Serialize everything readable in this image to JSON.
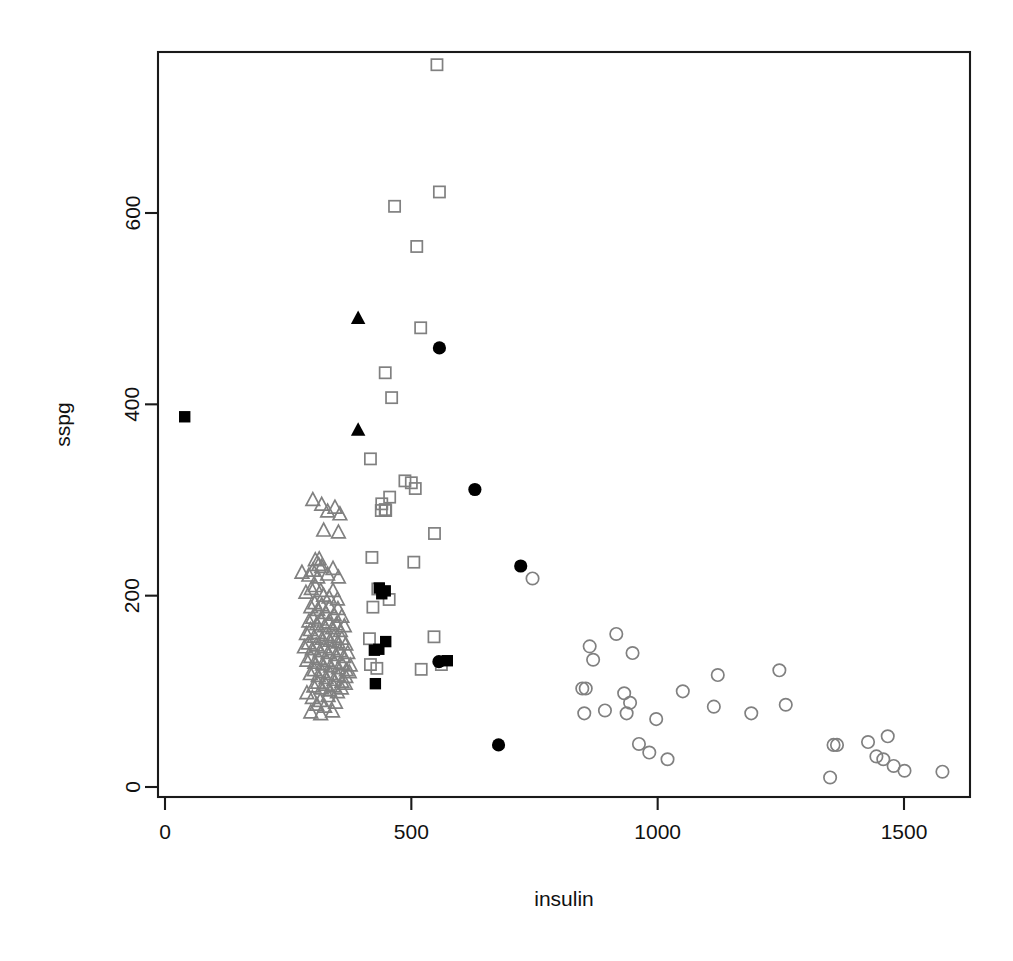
{
  "chart_data": {
    "type": "scatter",
    "title": "",
    "subtitle": "",
    "xlabel": "insulin",
    "ylabel": "sspg",
    "xlim": [
      -40,
      1640
    ],
    "ylim": [
      -35,
      790
    ],
    "xticks": [
      0,
      500,
      1000,
      1500
    ],
    "yticks": [
      0,
      200,
      400,
      600
    ],
    "xtick_labels": [
      "0",
      "500",
      "1000",
      "1500"
    ],
    "ytick_labels": [
      "0",
      "200",
      "400",
      "600"
    ],
    "grid": false,
    "legend": "none",
    "box": true,
    "colors": {
      "grey_marker": "#808080",
      "black_marker": "#000000",
      "axis": "#1a1a1a",
      "background": "#ffffff"
    },
    "series": [
      {
        "name": "open-triangle-grey",
        "marker": "triangle",
        "filled": false,
        "color": "#808080",
        "points": [
          [
            300,
            300
          ],
          [
            318,
            295
          ],
          [
            330,
            288
          ],
          [
            345,
            292
          ],
          [
            355,
            285
          ],
          [
            322,
            268
          ],
          [
            352,
            266
          ],
          [
            305,
            237
          ],
          [
            313,
            238
          ],
          [
            312,
            232
          ],
          [
            278,
            224
          ],
          [
            292,
            221
          ],
          [
            300,
            226
          ],
          [
            310,
            219
          ],
          [
            318,
            230
          ],
          [
            330,
            222
          ],
          [
            341,
            228
          ],
          [
            352,
            219
          ],
          [
            297,
            207
          ],
          [
            305,
            210
          ],
          [
            286,
            203
          ],
          [
            316,
            205
          ],
          [
            322,
            200
          ],
          [
            333,
            198
          ],
          [
            341,
            205
          ],
          [
            350,
            196
          ],
          [
            296,
            188
          ],
          [
            304,
            192
          ],
          [
            310,
            185
          ],
          [
            318,
            190
          ],
          [
            326,
            182
          ],
          [
            334,
            188
          ],
          [
            343,
            180
          ],
          [
            351,
            186
          ],
          [
            359,
            178
          ],
          [
            292,
            173
          ],
          [
            300,
            177
          ],
          [
            308,
            170
          ],
          [
            316,
            175
          ],
          [
            324,
            168
          ],
          [
            332,
            172
          ],
          [
            340,
            166
          ],
          [
            348,
            170
          ],
          [
            356,
            163
          ],
          [
            364,
            168
          ],
          [
            287,
            160
          ],
          [
            295,
            164
          ],
          [
            303,
            157
          ],
          [
            311,
            161
          ],
          [
            319,
            155
          ],
          [
            327,
            159
          ],
          [
            335,
            153
          ],
          [
            343,
            157
          ],
          [
            351,
            151
          ],
          [
            359,
            155
          ],
          [
            367,
            149
          ],
          [
            283,
            146
          ],
          [
            291,
            150
          ],
          [
            299,
            144
          ],
          [
            307,
            148
          ],
          [
            315,
            142
          ],
          [
            323,
            146
          ],
          [
            331,
            140
          ],
          [
            339,
            144
          ],
          [
            347,
            138
          ],
          [
            355,
            142
          ],
          [
            363,
            136
          ],
          [
            371,
            140
          ],
          [
            288,
            132
          ],
          [
            296,
            136
          ],
          [
            304,
            130
          ],
          [
            312,
            134
          ],
          [
            320,
            128
          ],
          [
            328,
            132
          ],
          [
            336,
            126
          ],
          [
            344,
            130
          ],
          [
            352,
            124
          ],
          [
            360,
            128
          ],
          [
            368,
            122
          ],
          [
            376,
            127
          ],
          [
            295,
            118
          ],
          [
            303,
            122
          ],
          [
            311,
            116
          ],
          [
            319,
            120
          ],
          [
            327,
            114
          ],
          [
            335,
            118
          ],
          [
            343,
            112
          ],
          [
            351,
            116
          ],
          [
            359,
            110
          ],
          [
            367,
            115
          ],
          [
            302,
            105
          ],
          [
            310,
            109
          ],
          [
            318,
            103
          ],
          [
            326,
            107
          ],
          [
            334,
            101
          ],
          [
            342,
            105
          ],
          [
            350,
            99
          ],
          [
            358,
            103
          ],
          [
            366,
            108
          ],
          [
            374,
            120
          ],
          [
            299,
            93
          ],
          [
            315,
            90
          ],
          [
            331,
            95
          ],
          [
            288,
            98
          ],
          [
            308,
            86
          ],
          [
            324,
            84
          ],
          [
            346,
            88
          ],
          [
            296,
            78
          ],
          [
            316,
            76
          ],
          [
            340,
            79
          ]
        ]
      },
      {
        "name": "open-square-grey",
        "marker": "square",
        "filled": false,
        "color": "#808080",
        "points": [
          [
            552,
            755
          ],
          [
            557,
            622
          ],
          [
            466,
            607
          ],
          [
            511,
            565
          ],
          [
            519,
            480
          ],
          [
            447,
            433
          ],
          [
            460,
            407
          ],
          [
            417,
            343
          ],
          [
            487,
            320
          ],
          [
            500,
            318
          ],
          [
            508,
            312
          ],
          [
            456,
            303
          ],
          [
            440,
            296
          ],
          [
            447,
            290
          ],
          [
            439,
            289
          ],
          [
            448,
            289
          ],
          [
            547,
            265
          ],
          [
            420,
            240
          ],
          [
            505,
            235
          ],
          [
            432,
            207
          ],
          [
            455,
            196
          ],
          [
            422,
            188
          ],
          [
            546,
            157
          ],
          [
            415,
            155
          ],
          [
            417,
            128
          ],
          [
            430,
            124
          ],
          [
            520,
            123
          ],
          [
            561,
            128
          ]
        ]
      },
      {
        "name": "filled-square-black",
        "marker": "square",
        "filled": true,
        "color": "#000000",
        "points": [
          [
            40,
            387
          ],
          [
            435,
            208
          ],
          [
            440,
            202
          ],
          [
            447,
            205
          ],
          [
            448,
            152
          ],
          [
            425,
            143
          ],
          [
            434,
            144
          ],
          [
            427,
            108
          ],
          [
            573,
            132
          ]
        ]
      },
      {
        "name": "filled-triangle-black",
        "marker": "triangle",
        "filled": true,
        "color": "#000000",
        "points": [
          [
            392,
            490
          ],
          [
            392,
            373
          ]
        ]
      },
      {
        "name": "filled-circle-black",
        "marker": "circle",
        "filled": true,
        "color": "#000000",
        "points": [
          [
            557,
            459
          ],
          [
            629,
            311
          ],
          [
            722,
            231
          ],
          [
            556,
            131
          ],
          [
            677,
            44
          ]
        ]
      },
      {
        "name": "open-circle-grey",
        "marker": "circle",
        "filled": false,
        "color": "#808080",
        "points": [
          [
            746,
            218
          ],
          [
            862,
            147
          ],
          [
            869,
            133
          ],
          [
            916,
            160
          ],
          [
            949,
            140
          ],
          [
            847,
            103
          ],
          [
            854,
            103
          ],
          [
            932,
            98
          ],
          [
            944,
            88
          ],
          [
            937,
            77
          ],
          [
            851,
            77
          ],
          [
            893,
            80
          ],
          [
            1122,
            117
          ],
          [
            1247,
            122
          ],
          [
            1114,
            84
          ],
          [
            1190,
            77
          ],
          [
            1260,
            86
          ],
          [
            1051,
            100
          ],
          [
            997,
            71
          ],
          [
            962,
            45
          ],
          [
            983,
            36
          ],
          [
            1020,
            29
          ],
          [
            1357,
            44
          ],
          [
            1364,
            44
          ],
          [
            1427,
            47
          ],
          [
            1467,
            53
          ],
          [
            1444,
            32
          ],
          [
            1458,
            29
          ],
          [
            1479,
            22
          ],
          [
            1350,
            10
          ],
          [
            1501,
            17
          ],
          [
            1578,
            16
          ]
        ]
      }
    ]
  },
  "axes": {
    "x_title": "insulin",
    "y_title": "sspg"
  }
}
